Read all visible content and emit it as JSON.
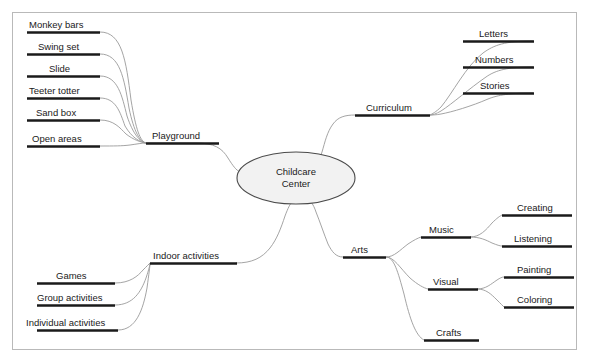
{
  "diagram": {
    "type": "mind-map",
    "title": "Childcare Center",
    "background_color": "#ffffff",
    "frame_color": "#b9b9b9",
    "connector_color": "#9a9a9a",
    "underline_color": "#1a1a1a",
    "center_fill_color": "#f2f2f2",
    "center_stroke_color": "#4a4a4a",
    "text_color": "#1a1a1a"
  },
  "center": {
    "line1": "Childcare",
    "line2": "Center"
  },
  "branches": {
    "playground": {
      "label": "Playground",
      "children": [
        {
          "label": "Monkey bars"
        },
        {
          "label": "Swing set"
        },
        {
          "label": "Slide"
        },
        {
          "label": "Teeter totter"
        },
        {
          "label": "Sand box"
        },
        {
          "label": "Open areas"
        }
      ]
    },
    "curriculum": {
      "label": "Curriculum",
      "children": [
        {
          "label": "Letters"
        },
        {
          "label": "Numbers"
        },
        {
          "label": "Stories"
        }
      ]
    },
    "indoor": {
      "label": "Indoor activities",
      "children": [
        {
          "label": "Games"
        },
        {
          "label": "Group activities"
        },
        {
          "label": "Individual activities"
        }
      ]
    },
    "arts": {
      "label": "Arts",
      "children": [
        {
          "label": "Music",
          "children": [
            {
              "label": "Creating"
            },
            {
              "label": "Listening"
            }
          ]
        },
        {
          "label": "Visual",
          "children": [
            {
              "label": "Painting"
            },
            {
              "label": "Coloring"
            }
          ]
        },
        {
          "label": "Crafts"
        }
      ]
    }
  }
}
